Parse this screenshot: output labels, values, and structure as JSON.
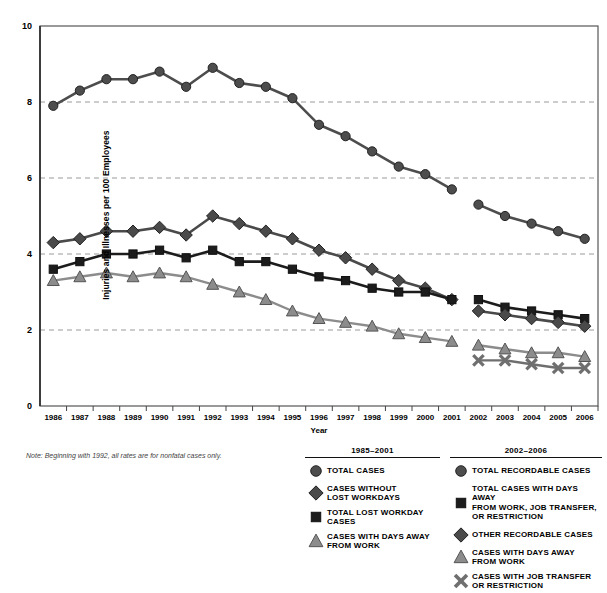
{
  "axis": {
    "ylabel": "Injuries and Illnesses per 100 Employees",
    "xlabel": "Year",
    "yticks": [
      "0",
      "2",
      "4",
      "6",
      "8",
      "10"
    ],
    "xticks": [
      "1986",
      "1987",
      "1988",
      "1989",
      "1990",
      "1991",
      "1992",
      "1993",
      "1994",
      "1995",
      "1996",
      "1997",
      "1998",
      "1999",
      "2000",
      "2001",
      "2002",
      "2003",
      "2004",
      "2005",
      "2006"
    ]
  },
  "note": "Note: Beginning with 1992, all rates are for nonfatal cases only.",
  "legend": {
    "left": {
      "title": "1985–2001",
      "items": [
        {
          "marker": "circle-marker",
          "label": "TOTAL CASES"
        },
        {
          "marker": "diamond-marker",
          "label": "CASES WITHOUT\nLOST WORKDAYS"
        },
        {
          "marker": "square-marker",
          "label": "TOTAL LOST WORKDAY\nCASES"
        },
        {
          "marker": "triangle-marker",
          "label": "CASES WITH DAYS AWAY\nFROM WORK"
        }
      ]
    },
    "right": {
      "title": "2002–2006",
      "items": [
        {
          "marker": "circle-marker",
          "label": "TOTAL RECORDABLE CASES"
        },
        {
          "marker": "square-marker",
          "label": "TOTAL CASES WITH DAYS AWAY\nFROM WORK,  JOB TRANSFER,\nOR RESTRICTION"
        },
        {
          "marker": "diamond-marker",
          "label": "OTHER RECORDABLE CASES"
        },
        {
          "marker": "triangle-marker",
          "label": "CASES WITH DAYS AWAY\nFROM WORK"
        },
        {
          "marker": "x-marker",
          "label": "CASES WITH  JOB TRANSFER\nOR RESTRICTION"
        }
      ]
    }
  },
  "colors": {
    "total_cases": "#4d4d4d",
    "diamond": "#4a4a4a",
    "square": "#1c1c1c",
    "triangle": "#8c8c8c",
    "xmark": "#6f6f6f",
    "grid": "#9a9a9a",
    "frame": "#555555"
  },
  "chart_data": {
    "type": "line",
    "title": "",
    "xlabel": "Year",
    "ylabel": "Injuries and Illnesses per 100 Employees",
    "ylim": [
      0,
      10
    ],
    "grid": "horizontal-dashed",
    "legend_position": "below-right",
    "x": [
      "1986",
      "1987",
      "1988",
      "1989",
      "1990",
      "1991",
      "1992",
      "1993",
      "1994",
      "1995",
      "1996",
      "1997",
      "1998",
      "1999",
      "2000",
      "2001",
      "2002",
      "2003",
      "2004",
      "2005",
      "2006"
    ],
    "series": [
      {
        "name": "TOTAL CASES",
        "period": "1985-2001",
        "marker": "circle",
        "x": [
          "1986",
          "1987",
          "1988",
          "1989",
          "1990",
          "1991",
          "1992",
          "1993",
          "1994",
          "1995",
          "1996",
          "1997",
          "1998",
          "1999",
          "2000",
          "2001"
        ],
        "values": [
          7.9,
          8.3,
          8.6,
          8.6,
          8.8,
          8.4,
          8.9,
          8.5,
          8.4,
          8.1,
          7.4,
          7.1,
          6.7,
          6.3,
          6.1,
          5.7
        ]
      },
      {
        "name": "CASES WITHOUT LOST WORKDAYS",
        "period": "1985-2001",
        "marker": "diamond",
        "x": [
          "1986",
          "1987",
          "1988",
          "1989",
          "1990",
          "1991",
          "1992",
          "1993",
          "1994",
          "1995",
          "1996",
          "1997",
          "1998",
          "1999",
          "2000",
          "2001"
        ],
        "values": [
          4.3,
          4.4,
          4.6,
          4.6,
          4.7,
          4.5,
          5.0,
          4.8,
          4.6,
          4.4,
          4.1,
          3.9,
          3.6,
          3.3,
          3.1,
          2.8
        ]
      },
      {
        "name": "TOTAL LOST WORKDAY CASES",
        "period": "1985-2001",
        "marker": "square",
        "x": [
          "1986",
          "1987",
          "1988",
          "1989",
          "1990",
          "1991",
          "1992",
          "1993",
          "1994",
          "1995",
          "1996",
          "1997",
          "1998",
          "1999",
          "2000",
          "2001"
        ],
        "values": [
          3.6,
          3.8,
          4.0,
          4.0,
          4.1,
          3.9,
          4.1,
          3.8,
          3.8,
          3.6,
          3.4,
          3.3,
          3.1,
          3.0,
          3.0,
          2.8
        ]
      },
      {
        "name": "CASES WITH DAYS AWAY FROM WORK",
        "period": "1985-2001",
        "marker": "triangle",
        "x": [
          "1986",
          "1987",
          "1988",
          "1989",
          "1990",
          "1991",
          "1992",
          "1993",
          "1994",
          "1995",
          "1996",
          "1997",
          "1998",
          "1999",
          "2000",
          "2001"
        ],
        "values": [
          3.3,
          3.4,
          3.5,
          3.4,
          3.5,
          3.4,
          3.2,
          3.0,
          2.8,
          2.5,
          2.3,
          2.2,
          2.1,
          1.9,
          1.8,
          1.7
        ]
      },
      {
        "name": "TOTAL RECORDABLE CASES",
        "period": "2002-2006",
        "marker": "circle",
        "x": [
          "2002",
          "2003",
          "2004",
          "2005",
          "2006"
        ],
        "values": [
          5.3,
          5.0,
          4.8,
          4.6,
          4.4
        ]
      },
      {
        "name": "TOTAL CASES WITH DAYS AWAY FROM WORK, JOB TRANSFER, OR RESTRICTION",
        "period": "2002-2006",
        "marker": "square",
        "x": [
          "2002",
          "2003",
          "2004",
          "2005",
          "2006"
        ],
        "values": [
          2.8,
          2.6,
          2.5,
          2.4,
          2.3
        ]
      },
      {
        "name": "OTHER RECORDABLE CASES",
        "period": "2002-2006",
        "marker": "diamond",
        "x": [
          "2002",
          "2003",
          "2004",
          "2005",
          "2006"
        ],
        "values": [
          2.5,
          2.4,
          2.3,
          2.2,
          2.1
        ]
      },
      {
        "name": "CASES WITH DAYS AWAY FROM WORK",
        "period": "2002-2006",
        "marker": "triangle",
        "x": [
          "2002",
          "2003",
          "2004",
          "2005",
          "2006"
        ],
        "values": [
          1.6,
          1.5,
          1.4,
          1.4,
          1.3
        ]
      },
      {
        "name": "CASES WITH JOB TRANSFER OR RESTRICTION",
        "period": "2002-2006",
        "marker": "x",
        "x": [
          "2002",
          "2003",
          "2004",
          "2005",
          "2006"
        ],
        "values": [
          1.2,
          1.2,
          1.1,
          1.0,
          1.0
        ]
      }
    ]
  }
}
